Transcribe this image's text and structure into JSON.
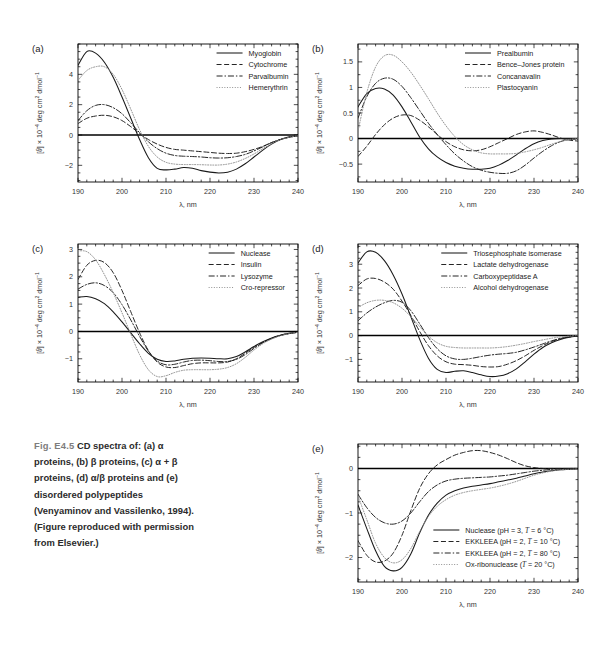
{
  "figure": {
    "caption_number": "Fig. E4.5",
    "caption_text": "CD spectra of: (a) α proteins, (b) β proteins, (c) α + β proteins, (d) α/β proteins and (e) disordered polypeptides (Venyaminov and Vassilenko, 1994). (Figure reproduced with permission from Elsevier.)",
    "caption_segments": [
      "CD spectra of:",
      "(a) α proteins, (b) β",
      "proteins, (c) α + β",
      "proteins, (d) α/β proteins",
      "and (e) disordered",
      "polypeptides",
      "(Venyaminov and",
      "Vassilenko, 1994). (Figure",
      "reproduced with",
      "permission from Elsevier.)"
    ]
  },
  "common": {
    "xlabel": "λ, nm",
    "ylabel": "[θ] × 10⁻⁴ deg cm² dmol⁻¹",
    "xticks": [
      190,
      200,
      210,
      220,
      230,
      240
    ],
    "xlim": [
      190,
      240
    ],
    "line_color": "#1a1a1a",
    "axis_color": "#000000"
  },
  "chart_data": [
    {
      "panel": "a",
      "tag": "(a)",
      "type": "line",
      "title": "α proteins",
      "xlabel": "λ, nm",
      "ylabel": "[θ] × 10⁻⁴ deg cm² dmol⁻¹",
      "xlim": [
        190,
        240
      ],
      "ylim": [
        -3.1,
        6.0
      ],
      "xticks": [
        190,
        200,
        210,
        220,
        230,
        240
      ],
      "yticks": [
        -2,
        0,
        2,
        4
      ],
      "grid": false,
      "legend_position": "top-right",
      "x": [
        190,
        192,
        194,
        196,
        198,
        200,
        202,
        204,
        206,
        208,
        210,
        212,
        214,
        216,
        218,
        220,
        222,
        224,
        226,
        228,
        230,
        232,
        234,
        236,
        238,
        240
      ],
      "series": [
        {
          "name": "Myoglobin",
          "dash": "solid",
          "values": [
            4.6,
            5.5,
            5.4,
            4.8,
            3.8,
            2.5,
            1.1,
            -0.3,
            -1.5,
            -2.2,
            -2.3,
            -2.25,
            -2.15,
            -2.2,
            -2.35,
            -2.45,
            -2.5,
            -2.45,
            -2.25,
            -1.9,
            -1.45,
            -1.0,
            -0.6,
            -0.3,
            -0.12,
            -0.05
          ]
        },
        {
          "name": "Cytochrome",
          "dash": "dashed",
          "values": [
            0.75,
            1.1,
            1.25,
            1.3,
            1.2,
            0.95,
            0.55,
            0.1,
            -0.3,
            -0.6,
            -0.82,
            -0.95,
            -1.0,
            -1.05,
            -1.1,
            -1.15,
            -1.2,
            -1.22,
            -1.2,
            -1.1,
            -0.95,
            -0.75,
            -0.5,
            -0.3,
            -0.15,
            -0.05
          ]
        },
        {
          "name": "Parvalbumin",
          "dash": "dashdot",
          "values": [
            0.95,
            1.6,
            1.95,
            2.0,
            1.8,
            1.4,
            0.8,
            0.15,
            -0.45,
            -0.9,
            -1.2,
            -1.35,
            -1.4,
            -1.42,
            -1.45,
            -1.5,
            -1.52,
            -1.5,
            -1.42,
            -1.28,
            -1.05,
            -0.78,
            -0.5,
            -0.3,
            -0.15,
            -0.05
          ]
        },
        {
          "name": "Hemerythrin",
          "dash": "dotted",
          "values": [
            3.6,
            4.25,
            4.5,
            4.5,
            4.0,
            3.0,
            1.7,
            0.35,
            -0.75,
            -1.45,
            -1.8,
            -1.92,
            -1.95,
            -1.95,
            -1.96,
            -1.98,
            -1.98,
            -1.92,
            -1.78,
            -1.55,
            -1.25,
            -0.9,
            -0.58,
            -0.32,
            -0.15,
            -0.05
          ]
        }
      ]
    },
    {
      "panel": "b",
      "tag": "(b)",
      "type": "line",
      "title": "β proteins",
      "xlabel": "λ, nm",
      "ylabel": "[θ] × 10⁻⁴ deg cm² dmol⁻¹",
      "xlim": [
        190,
        240
      ],
      "ylim": [
        -0.85,
        1.85
      ],
      "xticks": [
        190,
        200,
        210,
        220,
        230,
        240
      ],
      "yticks": [
        -0.5,
        0,
        0.5,
        1,
        1.5
      ],
      "grid": false,
      "legend_position": "top-right",
      "x": [
        190,
        192,
        194,
        196,
        198,
        200,
        202,
        204,
        206,
        208,
        210,
        212,
        214,
        216,
        218,
        220,
        222,
        224,
        226,
        228,
        230,
        232,
        234,
        236,
        238,
        240
      ],
      "series": [
        {
          "name": "Prealbumin",
          "dash": "solid",
          "values": [
            0.62,
            0.88,
            0.98,
            0.97,
            0.85,
            0.62,
            0.33,
            0.03,
            -0.2,
            -0.36,
            -0.47,
            -0.54,
            -0.58,
            -0.6,
            -0.6,
            -0.58,
            -0.52,
            -0.43,
            -0.32,
            -0.2,
            -0.1,
            -0.04,
            -0.01,
            0.0,
            0.0,
            0.0
          ]
        },
        {
          "name": "Bence–Jones protein",
          "dash": "dashed",
          "values": [
            -0.35,
            -0.15,
            0.08,
            0.27,
            0.4,
            0.46,
            0.45,
            0.36,
            0.23,
            0.08,
            -0.06,
            -0.16,
            -0.22,
            -0.24,
            -0.22,
            -0.16,
            -0.08,
            0.0,
            0.08,
            0.13,
            0.15,
            0.12,
            0.07,
            0.01,
            -0.03,
            -0.05
          ]
        },
        {
          "name": "Concanavalin",
          "dash": "dashdot",
          "values": [
            0.4,
            0.82,
            1.08,
            1.18,
            1.16,
            1.02,
            0.8,
            0.55,
            0.3,
            0.08,
            -0.12,
            -0.3,
            -0.44,
            -0.55,
            -0.62,
            -0.66,
            -0.68,
            -0.68,
            -0.63,
            -0.52,
            -0.38,
            -0.25,
            -0.14,
            -0.06,
            -0.02,
            -0.01
          ]
        },
        {
          "name": "Plastocyanin",
          "dash": "dotted",
          "values": [
            0.15,
            0.9,
            1.4,
            1.62,
            1.63,
            1.5,
            1.3,
            1.05,
            0.78,
            0.5,
            0.25,
            0.04,
            -0.12,
            -0.22,
            -0.28,
            -0.3,
            -0.3,
            -0.3,
            -0.29,
            -0.26,
            -0.22,
            -0.17,
            -0.11,
            -0.06,
            -0.02,
            0.0
          ]
        }
      ]
    },
    {
      "panel": "c",
      "tag": "(c)",
      "type": "line",
      "title": "α + β proteins",
      "xlabel": "λ, nm",
      "ylabel": "[θ] × 10⁻⁴ deg cm² dmol⁻¹",
      "xlim": [
        190,
        240
      ],
      "ylim": [
        -1.85,
        3.2
      ],
      "xticks": [
        190,
        200,
        210,
        220,
        230,
        240
      ],
      "yticks": [
        -1,
        0,
        1,
        2,
        3
      ],
      "grid": false,
      "legend_position": "top-right",
      "x": [
        190,
        192,
        194,
        196,
        198,
        200,
        202,
        204,
        206,
        208,
        210,
        212,
        214,
        216,
        218,
        220,
        222,
        224,
        226,
        228,
        230,
        232,
        234,
        236,
        238,
        240
      ],
      "series": [
        {
          "name": "Nuclease",
          "dash": "solid",
          "values": [
            1.25,
            1.28,
            1.2,
            1.02,
            0.72,
            0.35,
            -0.05,
            -0.45,
            -0.8,
            -1.02,
            -1.1,
            -1.08,
            -1.02,
            -0.98,
            -0.97,
            -0.98,
            -1.0,
            -1.0,
            -0.92,
            -0.75,
            -0.55,
            -0.38,
            -0.24,
            -0.14,
            -0.07,
            -0.03
          ]
        },
        {
          "name": "Insulin",
          "dash": "dashed",
          "values": [
            1.9,
            2.42,
            2.6,
            2.52,
            2.15,
            1.5,
            0.72,
            -0.05,
            -0.7,
            -1.12,
            -1.3,
            -1.32,
            -1.25,
            -1.18,
            -1.15,
            -1.15,
            -1.15,
            -1.12,
            -1.0,
            -0.8,
            -0.58,
            -0.4,
            -0.25,
            -0.14,
            -0.07,
            -0.03
          ]
        },
        {
          "name": "Lysozyme",
          "dash": "dashdot",
          "values": [
            1.55,
            1.72,
            1.78,
            1.68,
            1.42,
            0.98,
            0.42,
            -0.18,
            -0.72,
            -1.08,
            -1.22,
            -1.2,
            -1.12,
            -1.06,
            -1.05,
            -1.07,
            -1.1,
            -1.1,
            -1.02,
            -0.85,
            -0.62,
            -0.42,
            -0.26,
            -0.15,
            -0.08,
            -0.03
          ]
        },
        {
          "name": "Cro-repressor",
          "dash": "dotted",
          "values": [
            2.95,
            2.92,
            2.62,
            2.08,
            1.42,
            0.68,
            -0.1,
            -0.85,
            -1.4,
            -1.65,
            -1.62,
            -1.5,
            -1.42,
            -1.4,
            -1.4,
            -1.4,
            -1.38,
            -1.32,
            -1.18,
            -0.95,
            -0.68,
            -0.45,
            -0.28,
            -0.16,
            -0.08,
            -0.03
          ]
        }
      ]
    },
    {
      "panel": "d",
      "tag": "(d)",
      "type": "line",
      "title": "α/β proteins",
      "xlabel": "λ, nm",
      "ylabel": "[θ] × 10⁻⁴ deg cm² dmol⁻¹",
      "xlim": [
        190,
        240
      ],
      "ylim": [
        -1.95,
        3.85
      ],
      "xticks": [
        190,
        200,
        210,
        220,
        230,
        240
      ],
      "yticks": [
        -1,
        0,
        1,
        2,
        3
      ],
      "grid": false,
      "legend_position": "top-right",
      "x": [
        190,
        192,
        194,
        196,
        198,
        200,
        202,
        204,
        206,
        208,
        210,
        212,
        214,
        216,
        218,
        220,
        222,
        224,
        226,
        228,
        230,
        232,
        234,
        236,
        238,
        240
      ],
      "series": [
        {
          "name": "Triosephosphate isomerase",
          "dash": "solid",
          "values": [
            3.05,
            3.52,
            3.5,
            3.15,
            2.55,
            1.75,
            0.8,
            -0.15,
            -0.95,
            -1.42,
            -1.55,
            -1.5,
            -1.48,
            -1.55,
            -1.65,
            -1.72,
            -1.7,
            -1.6,
            -1.4,
            -1.1,
            -0.78,
            -0.5,
            -0.3,
            -0.16,
            -0.07,
            -0.02
          ]
        },
        {
          "name": "Lactate dehydrogenase",
          "dash": "dashed",
          "values": [
            2.1,
            2.38,
            2.4,
            2.25,
            1.95,
            1.45,
            0.85,
            0.18,
            -0.42,
            -0.85,
            -1.1,
            -1.2,
            -1.22,
            -1.25,
            -1.3,
            -1.32,
            -1.3,
            -1.2,
            -1.05,
            -0.85,
            -0.62,
            -0.42,
            -0.25,
            -0.13,
            -0.06,
            -0.02
          ]
        },
        {
          "name": "Carboxypeptidase A",
          "dash": "dashdot",
          "values": [
            0.62,
            0.95,
            1.2,
            1.38,
            1.48,
            1.4,
            1.05,
            0.5,
            -0.08,
            -0.55,
            -0.85,
            -0.98,
            -1.0,
            -0.95,
            -0.88,
            -0.82,
            -0.78,
            -0.75,
            -0.7,
            -0.6,
            -0.48,
            -0.35,
            -0.22,
            -0.12,
            -0.05,
            -0.02
          ]
        },
        {
          "name": "Alcohol dehydrogenase",
          "dash": "dotted",
          "values": [
            1.18,
            1.38,
            1.48,
            1.48,
            1.38,
            1.15,
            0.8,
            0.38,
            -0.02,
            -0.3,
            -0.45,
            -0.5,
            -0.52,
            -0.52,
            -0.52,
            -0.52,
            -0.5,
            -0.46,
            -0.4,
            -0.33,
            -0.25,
            -0.18,
            -0.11,
            -0.06,
            -0.02,
            0.0
          ]
        }
      ]
    },
    {
      "panel": "e",
      "tag": "(e)",
      "type": "line",
      "title": "disordered polypeptides",
      "xlabel": "λ, nm",
      "ylabel": "[θ] × 10⁻⁴ deg cm² dmol⁻¹",
      "xlim": [
        190,
        240
      ],
      "ylim": [
        -2.55,
        0.55
      ],
      "xticks": [
        190,
        200,
        210,
        220,
        230,
        240
      ],
      "yticks": [
        -2,
        -1,
        0
      ],
      "grid": false,
      "legend_position": "bottom-right",
      "x": [
        190,
        192,
        194,
        196,
        198,
        200,
        202,
        204,
        206,
        208,
        210,
        212,
        214,
        216,
        218,
        220,
        222,
        224,
        226,
        228,
        230,
        232,
        234,
        236,
        238,
        240
      ],
      "series": [
        {
          "name": "Nuclease (pH = 3, T = 6 °C)",
          "dash": "solid",
          "values": [
            -0.82,
            -1.35,
            -1.85,
            -2.2,
            -2.3,
            -2.22,
            -1.92,
            -1.45,
            -1.05,
            -0.78,
            -0.6,
            -0.5,
            -0.44,
            -0.4,
            -0.37,
            -0.34,
            -0.3,
            -0.26,
            -0.22,
            -0.17,
            -0.12,
            -0.08,
            -0.05,
            -0.03,
            -0.02,
            -0.01
          ]
        },
        {
          "name": "EKKLEEA (pH = 2, T = 10 °C)",
          "dash": "dashed",
          "values": [
            -1.62,
            -1.95,
            -2.1,
            -2.08,
            -1.9,
            -1.5,
            -0.95,
            -0.45,
            -0.12,
            0.08,
            0.2,
            0.3,
            0.36,
            0.4,
            0.4,
            0.36,
            0.3,
            0.22,
            0.13,
            0.06,
            0.02,
            0.0,
            0.0,
            0.0,
            0.0,
            0.0
          ]
        },
        {
          "name": "EKKLEEA (pH = 2, T = 80 °C)",
          "dash": "dashdot",
          "values": [
            -0.58,
            -0.88,
            -1.1,
            -1.22,
            -1.25,
            -1.18,
            -1.0,
            -0.75,
            -0.52,
            -0.37,
            -0.28,
            -0.24,
            -0.22,
            -0.21,
            -0.2,
            -0.19,
            -0.17,
            -0.15,
            -0.12,
            -0.09,
            -0.06,
            -0.04,
            -0.02,
            -0.01,
            0.0,
            0.0
          ]
        },
        {
          "name": "Ox-ribonuclease (T = 20 °C)",
          "dash": "dotted",
          "values": [
            -0.62,
            -1.15,
            -1.68,
            -2.0,
            -2.12,
            -2.05,
            -1.8,
            -1.42,
            -1.08,
            -0.85,
            -0.7,
            -0.6,
            -0.54,
            -0.5,
            -0.47,
            -0.44,
            -0.4,
            -0.35,
            -0.29,
            -0.22,
            -0.15,
            -0.1,
            -0.06,
            -0.03,
            -0.02,
            -0.01
          ]
        }
      ]
    }
  ]
}
